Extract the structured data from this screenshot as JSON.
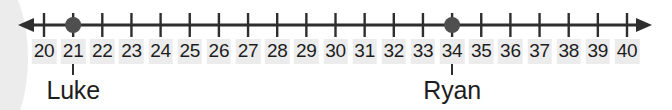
{
  "figure": {
    "axis": {
      "arrow_left": "left-arrowhead",
      "arrow_right": "right-arrowhead",
      "line_color": "#2e2e2e",
      "tick_color": "#2e2e2e"
    },
    "marker_color": "#4f4f4f",
    "label_box_color": "#ececec",
    "text_color": "#1d1d1d"
  },
  "chart_data": {
    "type": "scatter",
    "title": "",
    "xlabel": "",
    "ylabel": "",
    "grid": false,
    "legend_position": "none",
    "orientation": "horizontal-number-line",
    "xlim": [
      20,
      40
    ],
    "tick_step": 1,
    "categories": [
      "20",
      "21",
      "22",
      "23",
      "24",
      "25",
      "26",
      "27",
      "28",
      "29",
      "30",
      "31",
      "32",
      "33",
      "34",
      "35",
      "36",
      "37",
      "38",
      "39",
      "40"
    ],
    "tick_values": [
      20,
      21,
      22,
      23,
      24,
      25,
      26,
      27,
      28,
      29,
      30,
      31,
      32,
      33,
      34,
      35,
      36,
      37,
      38,
      39,
      40
    ],
    "points": [
      {
        "label": "Luke",
        "value": 21
      },
      {
        "label": "Ryan",
        "value": 34
      }
    ],
    "annotations": [
      "Luke",
      "Ryan"
    ]
  }
}
